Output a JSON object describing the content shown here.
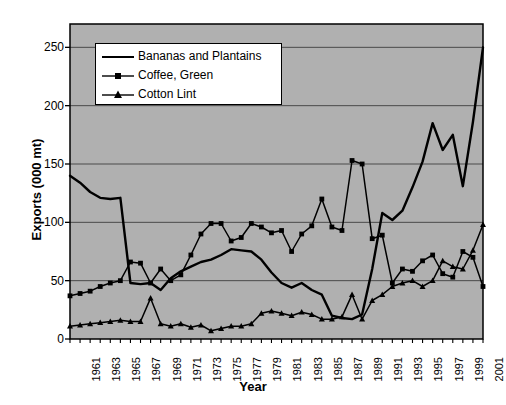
{
  "chart_data": {
    "type": "line",
    "title": "",
    "xlabel": "Year",
    "ylabel": "Exports (000 mt)",
    "xlim": [
      1961,
      2002
    ],
    "ylim": [
      0,
      270
    ],
    "yticks": [
      0,
      50,
      100,
      150,
      200,
      250
    ],
    "xticks": [
      1961,
      1963,
      1965,
      1967,
      1969,
      1971,
      1973,
      1975,
      1977,
      1979,
      1981,
      1983,
      1985,
      1987,
      1989,
      1991,
      1993,
      1995,
      1997,
      1999,
      2001
    ],
    "grid": "horizontal",
    "legend_position": "top-left-inside",
    "plot_background": "#b0b0b0",
    "line_color": "#000000",
    "x": [
      1961,
      1962,
      1963,
      1964,
      1965,
      1966,
      1967,
      1968,
      1969,
      1970,
      1971,
      1972,
      1973,
      1974,
      1975,
      1976,
      1977,
      1978,
      1979,
      1980,
      1981,
      1982,
      1983,
      1984,
      1985,
      1986,
      1987,
      1988,
      1989,
      1990,
      1991,
      1992,
      1993,
      1994,
      1995,
      1996,
      1997,
      1998,
      1999,
      2000,
      2001,
      2002
    ],
    "series": [
      {
        "name": "Bananas and Plantains",
        "marker": "none",
        "values": [
          140,
          134,
          126,
          121,
          120,
          121,
          48,
          47,
          48,
          42,
          52,
          58,
          62,
          66,
          68,
          72,
          77,
          76,
          75,
          68,
          57,
          48,
          44,
          48,
          42,
          38,
          20,
          18,
          17,
          21,
          60,
          108,
          102,
          110,
          130,
          152,
          185,
          162,
          175,
          131,
          186,
          250
        ],
        "ylim_note": "peaks at 250 in 2002"
      },
      {
        "name": "Coffee, Green",
        "marker": "square",
        "values": [
          37,
          39,
          41,
          45,
          48,
          50,
          66,
          65,
          48,
          60,
          50,
          55,
          72,
          90,
          99,
          99,
          84,
          87,
          99,
          96,
          91,
          93,
          75,
          90,
          97,
          120,
          96,
          93,
          153,
          150,
          86,
          89,
          48,
          60,
          58,
          67,
          72,
          56,
          53,
          75,
          70,
          45
        ]
      },
      {
        "name": "Cotton Lint",
        "marker": "triangle",
        "values": [
          11,
          12,
          13,
          14,
          15,
          16,
          15,
          15,
          35,
          13,
          11,
          13,
          10,
          12,
          7,
          9,
          11,
          11,
          13,
          22,
          24,
          22,
          20,
          23,
          21,
          17,
          17,
          19,
          38,
          17,
          33,
          38,
          45,
          48,
          50,
          45,
          50,
          67,
          62,
          60,
          76,
          98
        ]
      }
    ]
  }
}
